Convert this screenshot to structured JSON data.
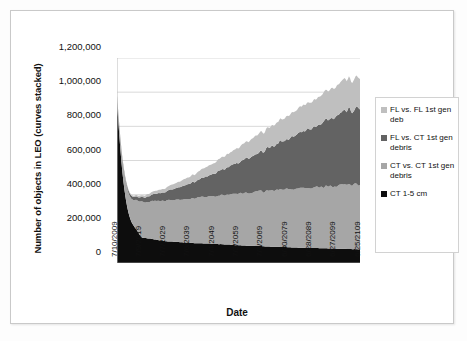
{
  "chart_data": {
    "type": "area",
    "stacked": true,
    "title": "",
    "xlabel": "Date",
    "ylabel": "Number of objects in LEO (curves stacked)",
    "ylim": [
      0,
      1200000
    ],
    "ytick_labels": [
      "1,200,000",
      "1,000,000",
      "800,000",
      "600,000",
      "400,000",
      "200,000",
      "0"
    ],
    "ytick_values": [
      1200000,
      1000000,
      800000,
      600000,
      400000,
      200000,
      0
    ],
    "grid": "horizontal",
    "legend_position": "right",
    "categories": [
      "7/10/2009",
      "7/9/2019",
      "7/7/2029",
      "7/6/2039",
      "7/4/2049",
      "7/3/2059",
      "7/1/2069",
      "6/30/2079",
      "6/28/2089",
      "6/27/2099",
      "6/25/2109"
    ],
    "series": [
      {
        "name": "CT 1-5 cm",
        "color": "#0d0d0d",
        "values": [
          370000,
          150000,
          128000,
          118000,
          112000,
          104000,
          98000,
          92000,
          88000,
          84000,
          80000
        ]
      },
      {
        "name": "CT vs. CT 1st gen debris",
        "color": "#a6a6a6",
        "values": [
          35000,
          205000,
          235000,
          258000,
          282000,
          300000,
          320000,
          338000,
          352000,
          366000,
          378000
        ]
      },
      {
        "name": "FL vs. CT 1st gen debris",
        "color": "#636363",
        "values": [
          5000,
          25000,
          52000,
          88000,
          132000,
          182000,
          236000,
          290000,
          348000,
          404000,
          452000
        ]
      },
      {
        "name": "FL vs. FL 1st gen deb",
        "color": "#bfbfbf",
        "values": [
          2000,
          10000,
          22000,
          40000,
          62000,
          88000,
          112000,
          136000,
          158000,
          176000,
          186000
        ]
      }
    ],
    "stack_top_totals": [
      412000,
      390000,
      437000,
      504000,
      588000,
      674000,
      766000,
      856000,
      946000,
      1030000,
      1096000
    ]
  },
  "legend": {
    "entries": [
      {
        "label": "FL vs. FL 1st gen deb",
        "color": "#bfbfbf"
      },
      {
        "label": "FL vs. CT 1st gen debris",
        "color": "#636363"
      },
      {
        "label": "CT vs. CT 1st gen debris",
        "color": "#a6a6a6"
      },
      {
        "label": "CT 1-5 cm",
        "color": "#0d0d0d"
      }
    ]
  }
}
